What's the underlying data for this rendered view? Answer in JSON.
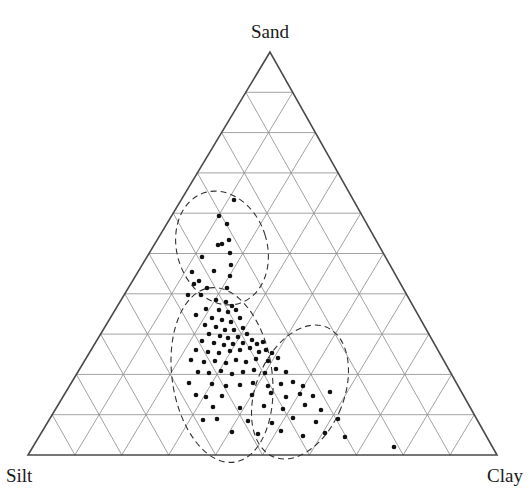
{
  "figure": {
    "type": "ternary-diagram",
    "background": "#ffffff",
    "width": 530,
    "height": 503
  },
  "chart_data": {
    "type": "scatter",
    "subtype": "ternary",
    "title": "",
    "xlabel": "",
    "ylabel": "",
    "grid": true,
    "legend_position": "none",
    "axes": [
      {
        "name": "Sand",
        "position": "top",
        "label": "Sand",
        "divisions": 10,
        "range": [
          0,
          100
        ]
      },
      {
        "name": "Silt",
        "position": "bottom-left",
        "label": "Silt",
        "divisions": 10,
        "range": [
          0,
          100
        ]
      },
      {
        "name": "Clay",
        "position": "bottom-right",
        "label": "Clay",
        "divisions": 10,
        "range": [
          0,
          100
        ]
      }
    ],
    "corner_labels": {
      "top": "Sand",
      "bottom_left": "Silt",
      "bottom_right": "Clay"
    },
    "geometry": {
      "apex": {
        "x": 270,
        "y": 52
      },
      "bottom_left": {
        "x": 28,
        "y": 455
      },
      "bottom_right": {
        "x": 497,
        "y": 455
      },
      "subdivisions": 10,
      "outline_color": "#4a4a4a",
      "grid_color": "#8a8a8a",
      "outline_width": 1.6,
      "grid_width": 0.8
    },
    "point_style": {
      "marker": "circle",
      "color": "#111111",
      "radius": 2.3,
      "count": 96
    },
    "points": [
      {
        "x": 234,
        "y": 200
      },
      {
        "x": 219,
        "y": 216
      },
      {
        "x": 227,
        "y": 224
      },
      {
        "x": 229,
        "y": 240
      },
      {
        "x": 230,
        "y": 253
      },
      {
        "x": 222,
        "y": 244
      },
      {
        "x": 218,
        "y": 245
      },
      {
        "x": 231,
        "y": 265
      },
      {
        "x": 202,
        "y": 257
      },
      {
        "x": 230,
        "y": 276
      },
      {
        "x": 214,
        "y": 271
      },
      {
        "x": 192,
        "y": 272
      },
      {
        "x": 194,
        "y": 284
      },
      {
        "x": 199,
        "y": 281
      },
      {
        "x": 207,
        "y": 288
      },
      {
        "x": 227,
        "y": 288
      },
      {
        "x": 188,
        "y": 295
      },
      {
        "x": 201,
        "y": 295
      },
      {
        "x": 216,
        "y": 300
      },
      {
        "x": 226,
        "y": 302
      },
      {
        "x": 232,
        "y": 306
      },
      {
        "x": 206,
        "y": 309
      },
      {
        "x": 219,
        "y": 310
      },
      {
        "x": 228,
        "y": 312
      },
      {
        "x": 236,
        "y": 310
      },
      {
        "x": 196,
        "y": 315
      },
      {
        "x": 212,
        "y": 318
      },
      {
        "x": 222,
        "y": 320
      },
      {
        "x": 231,
        "y": 322
      },
      {
        "x": 240,
        "y": 318
      },
      {
        "x": 205,
        "y": 325
      },
      {
        "x": 216,
        "y": 327
      },
      {
        "x": 225,
        "y": 330
      },
      {
        "x": 234,
        "y": 330
      },
      {
        "x": 243,
        "y": 328
      },
      {
        "x": 209,
        "y": 334
      },
      {
        "x": 220,
        "y": 336
      },
      {
        "x": 228,
        "y": 338
      },
      {
        "x": 238,
        "y": 337
      },
      {
        "x": 247,
        "y": 334
      },
      {
        "x": 202,
        "y": 341
      },
      {
        "x": 214,
        "y": 343
      },
      {
        "x": 224,
        "y": 345
      },
      {
        "x": 233,
        "y": 344
      },
      {
        "x": 243,
        "y": 343
      },
      {
        "x": 252,
        "y": 340
      },
      {
        "x": 257,
        "y": 344
      },
      {
        "x": 263,
        "y": 342
      },
      {
        "x": 196,
        "y": 350
      },
      {
        "x": 208,
        "y": 352
      },
      {
        "x": 219,
        "y": 353
      },
      {
        "x": 230,
        "y": 351
      },
      {
        "x": 240,
        "y": 350
      },
      {
        "x": 250,
        "y": 348
      },
      {
        "x": 259,
        "y": 352
      },
      {
        "x": 266,
        "y": 350
      },
      {
        "x": 272,
        "y": 353
      },
      {
        "x": 191,
        "y": 360
      },
      {
        "x": 204,
        "y": 362
      },
      {
        "x": 215,
        "y": 361
      },
      {
        "x": 226,
        "y": 363
      },
      {
        "x": 236,
        "y": 360
      },
      {
        "x": 246,
        "y": 362
      },
      {
        "x": 256,
        "y": 359
      },
      {
        "x": 268,
        "y": 361
      },
      {
        "x": 278,
        "y": 358
      },
      {
        "x": 198,
        "y": 372
      },
      {
        "x": 209,
        "y": 373
      },
      {
        "x": 221,
        "y": 371
      },
      {
        "x": 232,
        "y": 374
      },
      {
        "x": 243,
        "y": 372
      },
      {
        "x": 254,
        "y": 370
      },
      {
        "x": 265,
        "y": 373
      },
      {
        "x": 276,
        "y": 369
      },
      {
        "x": 286,
        "y": 372
      },
      {
        "x": 189,
        "y": 383
      },
      {
        "x": 212,
        "y": 384
      },
      {
        "x": 226,
        "y": 386
      },
      {
        "x": 240,
        "y": 385
      },
      {
        "x": 253,
        "y": 383
      },
      {
        "x": 268,
        "y": 386
      },
      {
        "x": 281,
        "y": 384
      },
      {
        "x": 293,
        "y": 382
      },
      {
        "x": 303,
        "y": 386
      },
      {
        "x": 196,
        "y": 395
      },
      {
        "x": 206,
        "y": 397
      },
      {
        "x": 222,
        "y": 396
      },
      {
        "x": 252,
        "y": 395
      },
      {
        "x": 271,
        "y": 393
      },
      {
        "x": 286,
        "y": 397
      },
      {
        "x": 300,
        "y": 394
      },
      {
        "x": 313,
        "y": 396
      },
      {
        "x": 330,
        "y": 392
      },
      {
        "x": 213,
        "y": 407
      },
      {
        "x": 240,
        "y": 408
      },
      {
        "x": 264,
        "y": 406
      },
      {
        "x": 283,
        "y": 409
      },
      {
        "x": 305,
        "y": 405
      },
      {
        "x": 321,
        "y": 410
      },
      {
        "x": 203,
        "y": 420
      },
      {
        "x": 217,
        "y": 419
      },
      {
        "x": 248,
        "y": 421
      },
      {
        "x": 272,
        "y": 423
      },
      {
        "x": 293,
        "y": 418
      },
      {
        "x": 316,
        "y": 422
      },
      {
        "x": 338,
        "y": 419
      },
      {
        "x": 232,
        "y": 432
      },
      {
        "x": 258,
        "y": 434
      },
      {
        "x": 281,
        "y": 431
      },
      {
        "x": 303,
        "y": 436
      },
      {
        "x": 325,
        "y": 433
      },
      {
        "x": 345,
        "y": 437
      },
      {
        "x": 394,
        "y": 447
      }
    ],
    "groupings": [
      {
        "name": "upper-cluster",
        "style": "dashed-ellipse",
        "cx": 222,
        "cy": 248,
        "rx": 45,
        "ry": 58,
        "rotation": -18
      },
      {
        "name": "middle-cluster",
        "style": "dashed-ellipse",
        "cx": 222,
        "cy": 375,
        "rx": 50,
        "ry": 88,
        "rotation": -8
      },
      {
        "name": "right-cluster",
        "style": "dashed-ellipse",
        "cx": 300,
        "cy": 392,
        "rx": 44,
        "ry": 70,
        "rotation": 22
      }
    ],
    "grouping_style": {
      "stroke": "#333333",
      "stroke_width": 1.1,
      "dash": "6 4",
      "fill": "none"
    }
  }
}
